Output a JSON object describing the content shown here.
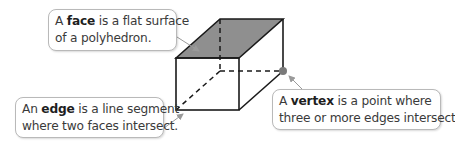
{
  "callouts": {
    "face": {
      "prefix": "A ",
      "term": "face",
      "line1_rest": " is a flat surface",
      "line2": "of a polyhedron."
    },
    "edge": {
      "prefix": "An ",
      "term": "edge",
      "line1_rest": " is a line segment",
      "line2": "where two faces intersect."
    },
    "vertex": {
      "prefix": "A ",
      "term": "vertex",
      "line1_rest": " is a point where",
      "line2": "three or more edges intersect."
    }
  },
  "colors": {
    "top_face": "#8f8f8f",
    "edge_line": "#1a1a1a",
    "vertex_dot": "#7a7a7a",
    "arrow": "#9a9a9a"
  }
}
